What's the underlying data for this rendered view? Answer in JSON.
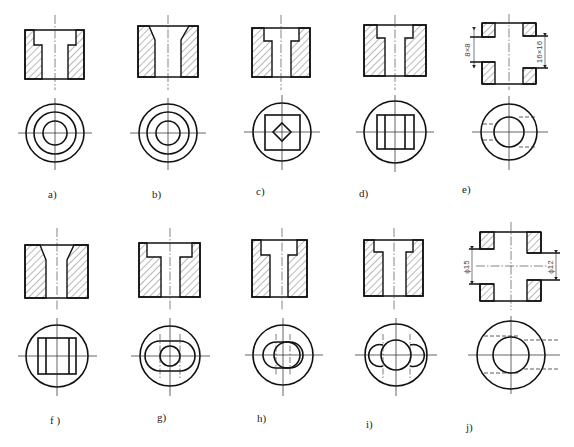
{
  "figure": {
    "panels": [
      {
        "id": "a",
        "label": "a)",
        "section": "counterbored through-hole (T-shaped)",
        "top_view": "three concentric circles"
      },
      {
        "id": "b",
        "label": "b)",
        "section": "countersunk (tapered) through-hole",
        "top_view": "three concentric circles"
      },
      {
        "id": "c",
        "label": "c)",
        "section": "stepped square hole",
        "top_view": "circle with square and inner diamond"
      },
      {
        "id": "d",
        "label": "d)",
        "section": "stepped hole",
        "top_view": "circle with rectangle split by two vertical lines"
      },
      {
        "id": "e",
        "label": "e)",
        "section": "cross holes, square",
        "top_view": "two concentric circles with hidden lines",
        "dimensions": [
          "8×8",
          "16×16"
        ]
      },
      {
        "id": "f",
        "label": "f)",
        "section": "tapered hole",
        "top_view": "circle with rectangle split by two vertical lines"
      },
      {
        "id": "g",
        "label": "g)",
        "section": "counterbored hole",
        "top_view": "circle with obround slot and inner circle"
      },
      {
        "id": "h",
        "label": "h)",
        "section": "counterbored hole",
        "top_view": "circle with two overlapping circles"
      },
      {
        "id": "i",
        "label": "i)",
        "section": "counterbored hole",
        "top_view": "circle with central circle and two side lobes"
      },
      {
        "id": "j",
        "label": "j)",
        "section": "cross holes, round",
        "top_view": "two concentric circles with hidden lines",
        "dimensions": [
          "ϕ15",
          "ϕ12"
        ]
      }
    ]
  },
  "labels": {
    "a": "a)",
    "b": "b)",
    "c": "c)",
    "d": "d)",
    "e": "e)",
    "f": "f )",
    "g": "g)",
    "h": "h)",
    "i": "i)",
    "j": "j)"
  },
  "dimensions": {
    "e_left": "8×8",
    "e_right": "16×16",
    "j_left": "ϕ15",
    "j_right": "ϕ12"
  },
  "colors": {
    "line": "#111111",
    "background": "#ffffff"
  }
}
